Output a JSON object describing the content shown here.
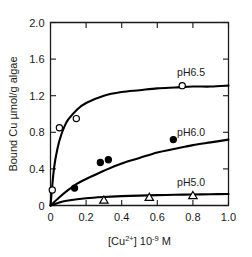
{
  "chart_data": {
    "type": "line",
    "title": "",
    "xlabel": "[Cu2+] 10-9 M",
    "xlabel_parts": {
      "prefix": "[Cu",
      "sup1": "2+",
      "mid": "] 10",
      "sup2": "-9",
      "suffix": " M"
    },
    "ylabel": "Bound Cu µmol/g algae",
    "xlim": [
      0,
      1.0
    ],
    "ylim": [
      0,
      2.0
    ],
    "xticks": [
      "0",
      "0.2",
      "0.4",
      "0.6",
      "0.8",
      "1.0"
    ],
    "xtick_values": [
      0,
      0.2,
      0.4,
      0.6,
      0.8,
      1.0
    ],
    "yticks": [
      "0",
      "0.4",
      "0.8",
      "1.2",
      "1.6",
      "2.0"
    ],
    "ytick_values": [
      0,
      0.4,
      0.8,
      1.2,
      1.6,
      2.0
    ],
    "grid": false,
    "legend_position": "inline-right-of-curve",
    "series": [
      {
        "name": "pH6.5",
        "label": "pH6.5",
        "marker": "open-circle",
        "label_x": 0.79,
        "label_y": 1.46,
        "points": [
          {
            "x": 0.01,
            "y": 0.17
          },
          {
            "x": 0.05,
            "y": 0.85
          },
          {
            "x": 0.145,
            "y": 0.95
          },
          {
            "x": 0.74,
            "y": 1.31
          }
        ],
        "curve_params": {
          "model": "langmuir",
          "qmax": 1.34,
          "k": 22.0
        },
        "curve_values": [
          {
            "x": 0.0,
            "y": 0.0
          },
          {
            "x": 0.02,
            "y": 0.41
          },
          {
            "x": 0.04,
            "y": 0.63
          },
          {
            "x": 0.06,
            "y": 0.77
          },
          {
            "x": 0.08,
            "y": 0.87
          },
          {
            "x": 0.1,
            "y": 0.94
          },
          {
            "x": 0.15,
            "y": 1.05
          },
          {
            "x": 0.2,
            "y": 1.12
          },
          {
            "x": 0.3,
            "y": 1.2
          },
          {
            "x": 0.4,
            "y": 1.24
          },
          {
            "x": 0.5,
            "y": 1.26
          },
          {
            "x": 0.6,
            "y": 1.28
          },
          {
            "x": 0.7,
            "y": 1.29
          },
          {
            "x": 0.8,
            "y": 1.3
          },
          {
            "x": 0.9,
            "y": 1.3
          },
          {
            "x": 1.0,
            "y": 1.31
          }
        ]
      },
      {
        "name": "pH6.0",
        "label": "pH6.0",
        "marker": "filled-circle",
        "label_x": 0.79,
        "label_y": 0.8,
        "points": [
          {
            "x": 0.135,
            "y": 0.19
          },
          {
            "x": 0.28,
            "y": 0.47
          },
          {
            "x": 0.325,
            "y": 0.5
          },
          {
            "x": 0.69,
            "y": 0.72
          }
        ],
        "curve_params": {
          "model": "langmuir",
          "qmax": 1.05,
          "k": 1.9
        },
        "curve_values": [
          {
            "x": 0.0,
            "y": 0.0
          },
          {
            "x": 0.05,
            "y": 0.09
          },
          {
            "x": 0.1,
            "y": 0.17
          },
          {
            "x": 0.15,
            "y": 0.24
          },
          {
            "x": 0.2,
            "y": 0.29
          },
          {
            "x": 0.3,
            "y": 0.38
          },
          {
            "x": 0.4,
            "y": 0.46
          },
          {
            "x": 0.5,
            "y": 0.52
          },
          {
            "x": 0.6,
            "y": 0.58
          },
          {
            "x": 0.7,
            "y": 0.62
          },
          {
            "x": 0.8,
            "y": 0.66
          },
          {
            "x": 0.9,
            "y": 0.69
          },
          {
            "x": 1.0,
            "y": 0.72
          }
        ]
      },
      {
        "name": "pH5.0",
        "label": "pH5.0",
        "marker": "open-triangle",
        "label_x": 0.79,
        "label_y": 0.26,
        "points": [
          {
            "x": 0.3,
            "y": 0.06
          },
          {
            "x": 0.555,
            "y": 0.09
          },
          {
            "x": 0.8,
            "y": 0.11
          }
        ],
        "curve_params": {
          "model": "langmuir",
          "qmax": 0.145,
          "k": 6.0
        },
        "curve_values": [
          {
            "x": 0.0,
            "y": 0.0
          },
          {
            "x": 0.05,
            "y": 0.033
          },
          {
            "x": 0.1,
            "y": 0.054
          },
          {
            "x": 0.2,
            "y": 0.079
          },
          {
            "x": 0.3,
            "y": 0.093
          },
          {
            "x": 0.4,
            "y": 0.102
          },
          {
            "x": 0.5,
            "y": 0.108
          },
          {
            "x": 0.6,
            "y": 0.113
          },
          {
            "x": 0.7,
            "y": 0.117
          },
          {
            "x": 0.8,
            "y": 0.12
          },
          {
            "x": 0.9,
            "y": 0.123
          },
          {
            "x": 1.0,
            "y": 0.125
          }
        ]
      }
    ]
  },
  "colors": {
    "ink": "#1a1a1a",
    "curve": "#000000",
    "background": "#ffffff"
  }
}
